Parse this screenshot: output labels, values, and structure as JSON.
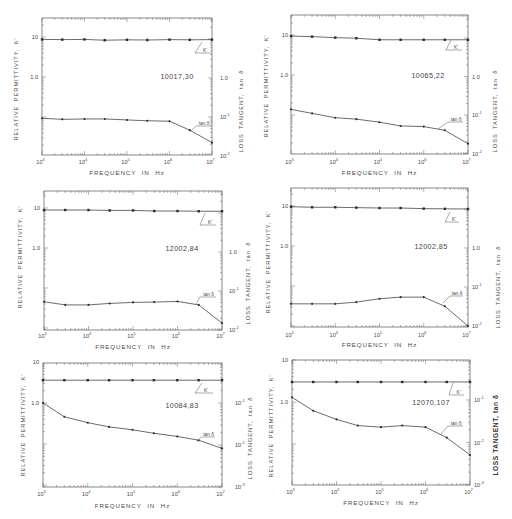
{
  "figure": {
    "xlabel": "FREQUENCY IN Hz",
    "left_ylabel": "RELATIVE PERMITTIVITY, K'",
    "right_ylabel": "LOSS TANGENT, tan δ",
    "k_callout": "K'",
    "tan_callout": "tan δ",
    "x_ticks": [
      {
        "base": "10",
        "exp": "3",
        "value": 1000
      },
      {
        "base": "10",
        "exp": "4",
        "value": 10000
      },
      {
        "base": "10",
        "exp": "5",
        "value": 100000
      },
      {
        "base": "10",
        "exp": "6",
        "value": 1000000
      },
      {
        "base": "10",
        "exp": "7",
        "value": 10000000
      }
    ]
  },
  "chart_data": [
    {
      "type": "line",
      "title": "10017,30",
      "xlabel": "FREQUENCY IN Hz",
      "ylabel": "RELATIVE PERMITTIVITY, K'",
      "y2label": "LOSS TANGENT, tan δ",
      "xscale": "log",
      "yscale": "log",
      "y2scale": "log",
      "xlim": [
        1000,
        10000000
      ],
      "x": [
        1000,
        3000,
        10000,
        30000,
        100000,
        300000,
        1000000,
        3000000,
        10000000
      ],
      "series": [
        {
          "name": "K'",
          "axis": "left",
          "values": [
            8.7,
            8.6,
            8.7,
            8.3,
            8.5,
            8.4,
            8.6,
            8.5,
            8.6
          ]
        },
        {
          "name": "tan δ",
          "axis": "right",
          "values": [
            0.093,
            0.087,
            0.089,
            0.089,
            0.084,
            0.08,
            0.078,
            0.046,
            0.022
          ]
        }
      ],
      "left_ticks": [
        {
          "label": "10",
          "value": 10
        },
        {
          "label": "1.0",
          "value": 1
        }
      ],
      "right_ticks": [
        {
          "base": "1.0",
          "exp": "",
          "value": 1
        },
        {
          "base": "10",
          "exp": "-1",
          "value": 0.1
        },
        {
          "base": "10",
          "exp": "-2",
          "value": 0.01
        }
      ]
    },
    {
      "type": "line",
      "title": "10065,22",
      "xlabel": "FREQUENCY IN Hz",
      "ylabel": "RELATIVE PERMITTIVITY, K'",
      "y2label": "LOSS TANGENT, tan δ",
      "xscale": "log",
      "yscale": "log",
      "y2scale": "log",
      "xlim": [
        1000,
        10000000
      ],
      "x": [
        1000,
        3000,
        10000,
        30000,
        100000,
        300000,
        1000000,
        3000000,
        10000000
      ],
      "series": [
        {
          "name": "K'",
          "axis": "left",
          "values": [
            9.4,
            9.1,
            8.6,
            8.3,
            7.6,
            7.6,
            7.6,
            7.6,
            7.6
          ]
        },
        {
          "name": "tan δ",
          "axis": "right",
          "values": [
            0.14,
            0.11,
            0.085,
            0.078,
            0.065,
            0.052,
            0.05,
            0.04,
            0.018
          ]
        }
      ],
      "left_ticks": [
        {
          "label": "10",
          "value": 10
        },
        {
          "label": "1.0",
          "value": 1
        }
      ],
      "right_ticks": [
        {
          "base": "1.0",
          "exp": "",
          "value": 1
        },
        {
          "base": "10",
          "exp": "-1",
          "value": 0.1
        },
        {
          "base": "10",
          "exp": "-2",
          "value": 0.01
        }
      ]
    },
    {
      "type": "line",
      "title": "12002,84",
      "xlabel": "FREQUENCY IN Hz",
      "ylabel": "RELATIVE PERMITTIVITY, K'",
      "y2label": "LOSS TANGENT, tan δ",
      "xscale": "log",
      "yscale": "log",
      "y2scale": "log",
      "xlim": [
        1000,
        10000000
      ],
      "x": [
        1000,
        3000,
        10000,
        30000,
        100000,
        300000,
        1000000,
        3000000,
        10000000
      ],
      "series": [
        {
          "name": "K'",
          "axis": "left",
          "values": [
            8.9,
            8.9,
            8.9,
            8.7,
            8.7,
            8.4,
            8.4,
            8.3,
            8.3
          ]
        },
        {
          "name": "tan δ",
          "axis": "right",
          "values": [
            0.053,
            0.044,
            0.044,
            0.048,
            0.051,
            0.052,
            0.054,
            0.044,
            0.015
          ]
        }
      ],
      "left_ticks": [
        {
          "label": "10",
          "value": 10
        },
        {
          "label": "1.0",
          "value": 1
        }
      ],
      "right_ticks": [
        {
          "base": "1.0",
          "exp": "",
          "value": 1
        },
        {
          "base": "10",
          "exp": "-1",
          "value": 0.1
        },
        {
          "base": "10",
          "exp": "-2",
          "value": 0.01
        }
      ]
    },
    {
      "type": "line",
      "title": "12002,85",
      "xlabel": "FREQUENCY IN Hz",
      "ylabel": "RELATIVE PERMITTIVITY, K'",
      "y2label": "LOSS TANGENT, tan δ",
      "xscale": "log",
      "yscale": "log",
      "y2scale": "log",
      "xlim": [
        1000,
        10000000
      ],
      "x": [
        1000,
        3000,
        10000,
        30000,
        100000,
        300000,
        1000000,
        3000000,
        10000000
      ],
      "series": [
        {
          "name": "K'",
          "axis": "left",
          "values": [
            9.6,
            9.3,
            9.3,
            9.1,
            8.9,
            8.9,
            8.6,
            8.5,
            8.4
          ]
        },
        {
          "name": "tan δ",
          "axis": "right",
          "values": [
            0.037,
            0.037,
            0.037,
            0.041,
            0.05,
            0.055,
            0.055,
            0.032,
            0.01
          ]
        }
      ],
      "left_ticks": [
        {
          "label": "10",
          "value": 10
        },
        {
          "label": "1.0",
          "value": 1
        }
      ],
      "right_ticks": [
        {
          "base": "1.0",
          "exp": "",
          "value": 1
        },
        {
          "base": "10",
          "exp": "-1",
          "value": 0.1
        },
        {
          "base": "10",
          "exp": "-2",
          "value": 0.01
        }
      ]
    },
    {
      "type": "line",
      "title": "10084,83",
      "xlabel": "FREQUENCY IN Hz",
      "ylabel": "RELATIVE PERMITTIVITY, K'",
      "y2label": "LOSS TANGENT, tan δ",
      "xscale": "log",
      "yscale": "log",
      "y2scale": "log",
      "xlim": [
        1000,
        10000000
      ],
      "x": [
        1000,
        3000,
        10000,
        30000,
        100000,
        300000,
        1000000,
        3000000,
        10000000
      ],
      "series": [
        {
          "name": "K'",
          "axis": "left",
          "values": [
            3.6,
            3.6,
            3.6,
            3.6,
            3.6,
            3.6,
            3.6,
            3.6,
            3.6
          ]
        },
        {
          "name": "tan δ",
          "axis": "right",
          "values": [
            0.1,
            0.047,
            0.034,
            0.027,
            0.023,
            0.019,
            0.016,
            0.013,
            0.0083
          ]
        }
      ],
      "left_ticks": [
        {
          "label": "10",
          "value": 10
        },
        {
          "label": "1.0",
          "value": 1
        }
      ],
      "right_ticks": [
        {
          "base": "10",
          "exp": "-1",
          "value": 0.1
        },
        {
          "base": "10",
          "exp": "-2",
          "value": 0.01
        },
        {
          "base": "10",
          "exp": "-3",
          "value": 0.001
        }
      ]
    },
    {
      "type": "line",
      "title": "12070,107",
      "xlabel": "FREQUENCY IN Hz",
      "ylabel": "RELATIVE PERMITTIVITY, K'",
      "y2label": "LOSS TANGENT, tan δ",
      "xscale": "log",
      "yscale": "log",
      "y2scale": "log",
      "xlim": [
        1000,
        10000000
      ],
      "x": [
        1000,
        3000,
        10000,
        30000,
        100000,
        300000,
        1000000,
        3000000,
        10000000
      ],
      "series": [
        {
          "name": "K'",
          "axis": "left",
          "values": [
            3.0,
            3.0,
            3.0,
            3.0,
            3.0,
            3.0,
            3.0,
            3.0,
            3.0
          ]
        },
        {
          "name": "tan δ",
          "axis": "right",
          "values": [
            0.116,
            0.056,
            0.035,
            0.025,
            0.023,
            0.025,
            0.023,
            0.013,
            0.0051
          ]
        }
      ],
      "left_ticks": [
        {
          "label": "10",
          "value": 10
        },
        {
          "label": "1.0",
          "value": 1
        }
      ],
      "right_ticks": [
        {
          "base": "10",
          "exp": "-1",
          "value": 0.1
        },
        {
          "base": "10",
          "exp": "-2",
          "value": 0.01
        },
        {
          "base": "10",
          "exp": "-3",
          "value": 0.001
        }
      ]
    }
  ]
}
